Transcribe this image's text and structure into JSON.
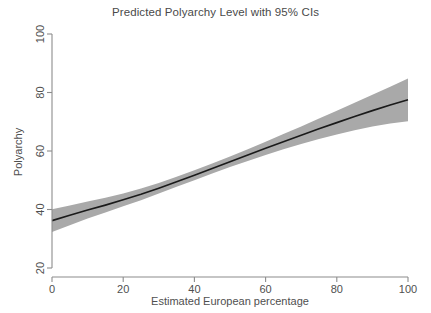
{
  "chart_data": {
    "type": "line",
    "title": "Predicted Polyarchy Level with 95% CIs",
    "xlabel": "Estimated European percentage",
    "ylabel": "Polyarchy",
    "xlim": [
      0,
      100
    ],
    "ylim": [
      20,
      100
    ],
    "xticks": [
      0,
      20,
      40,
      60,
      80,
      100
    ],
    "yticks": [
      20,
      40,
      60,
      80,
      100
    ],
    "xtick_labels": [
      "0",
      "20",
      "40",
      "60",
      "80",
      "100"
    ],
    "ytick_labels": [
      "20",
      "40",
      "60",
      "80",
      "100"
    ],
    "grid": false,
    "legend": "none",
    "series": [
      {
        "name": "Predicted Polyarchy",
        "kind": "line",
        "color": "#1a1a1a",
        "x": [
          0,
          5,
          10,
          15,
          20,
          25,
          30,
          35,
          40,
          45,
          50,
          55,
          60,
          65,
          70,
          75,
          80,
          85,
          90,
          95,
          100
        ],
        "values": [
          36.2,
          38.0,
          39.8,
          41.5,
          43.3,
          45.2,
          47.3,
          49.5,
          51.7,
          54.0,
          56.3,
          58.6,
          60.9,
          63.2,
          65.4,
          67.6,
          69.7,
          71.8,
          73.8,
          75.7,
          77.5
        ]
      },
      {
        "name": "95% CI upper",
        "kind": "band-upper",
        "color": "#a9a9a9",
        "x": [
          0,
          5,
          10,
          15,
          20,
          25,
          30,
          35,
          40,
          45,
          50,
          55,
          60,
          65,
          70,
          75,
          80,
          85,
          90,
          95,
          100
        ],
        "values": [
          40.1,
          41.4,
          42.7,
          44.0,
          45.5,
          47.2,
          49.1,
          51.2,
          53.4,
          55.7,
          58.1,
          60.6,
          63.2,
          65.8,
          68.4,
          71.1,
          73.8,
          76.5,
          79.2,
          82.0,
          84.8
        ]
      },
      {
        "name": "95% CI lower",
        "kind": "band-lower",
        "color": "#a9a9a9",
        "x": [
          0,
          5,
          10,
          15,
          20,
          25,
          30,
          35,
          40,
          45,
          50,
          55,
          60,
          65,
          70,
          75,
          80,
          85,
          90,
          95,
          100
        ],
        "values": [
          32.3,
          34.6,
          36.9,
          39.0,
          41.1,
          43.2,
          45.5,
          47.8,
          50.0,
          52.3,
          54.5,
          56.6,
          58.6,
          60.6,
          62.4,
          64.1,
          65.6,
          67.1,
          68.4,
          69.4,
          70.2
        ]
      }
    ],
    "annotations": []
  },
  "colors": {
    "band_fill": "#a9a9a9",
    "line": "#1a1a1a",
    "axis": "#8c8c8c",
    "text": "#4f4f4f",
    "background": "#ffffff"
  }
}
